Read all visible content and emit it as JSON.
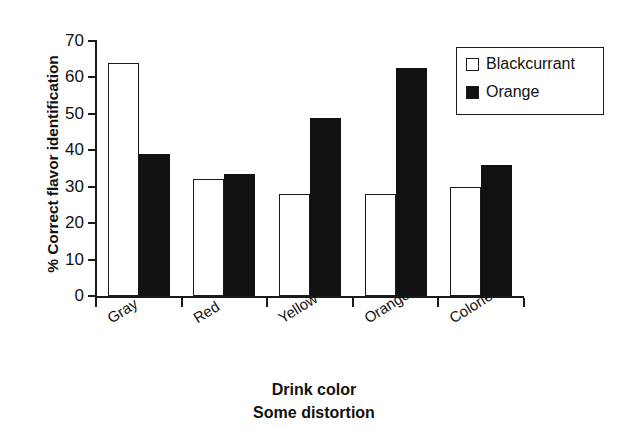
{
  "chart_data": {
    "type": "bar",
    "title": "",
    "xlabel": "Drink color",
    "sublabel": "Some distortion",
    "ylabel": "% Correct flavor identification",
    "categories": [
      "Gray",
      "Red",
      "Yellow",
      "Orange",
      "Colorless"
    ],
    "series": [
      {
        "name": "Blackcurrant",
        "style": "open",
        "color": "#ffffff",
        "values": [
          64,
          32,
          28,
          28,
          30
        ]
      },
      {
        "name": "Orange",
        "style": "filled",
        "color": "#111111",
        "values": [
          39,
          33.5,
          49,
          62.5,
          36
        ]
      }
    ],
    "ylim": [
      0,
      70
    ],
    "yticks": [
      70,
      60,
      50,
      40,
      30,
      20,
      10,
      0
    ],
    "ytick_labels": [
      "70",
      "60",
      "50",
      "40",
      "30",
      "20",
      "10",
      "0"
    ],
    "grid": false,
    "legend_position": "top-right",
    "legend_entries": [
      "Blackcurrant",
      "Orange"
    ]
  },
  "axis": {
    "y_title": "% Correct flavor identification",
    "x_title": "Drink color",
    "x_subtitle": "Some distortion"
  },
  "legend": {
    "items": [
      {
        "label": "Blackcurrant"
      },
      {
        "label": "Orange"
      }
    ]
  }
}
